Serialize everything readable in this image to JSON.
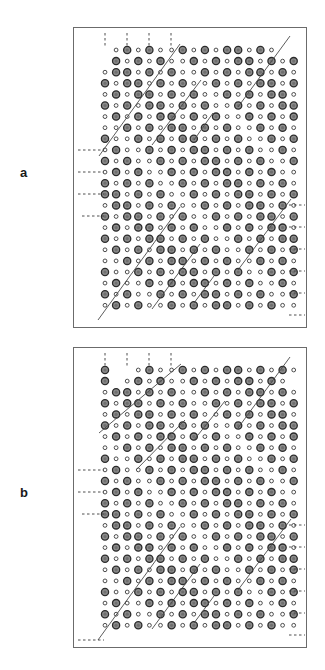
{
  "figure": {
    "type": "crystal-lattice-projection-diagram",
    "background_color": "#ffffff",
    "width": 325,
    "height": 670,
    "panels": [
      {
        "id": "a",
        "label": "a",
        "label_x": 20,
        "label_y": 172,
        "frame": {
          "x": 73,
          "y": 27,
          "w": 234,
          "h": 301
        },
        "origin": {
          "x": 105,
          "y": 50
        },
        "step": 11.1,
        "cols": 18,
        "rows": 24,
        "diagonals": [
          {
            "x1": 99,
            "y1": 156,
            "x2": 180,
            "y2": 44
          },
          {
            "x1": 152,
            "y1": 145,
            "x2": 201,
            "y2": 80
          },
          {
            "x1": 238,
            "y1": 107,
            "x2": 290,
            "y2": 36
          },
          {
            "x1": 194,
            "y1": 140,
            "x2": 213,
            "y2": 113
          },
          {
            "x1": 98,
            "y1": 320,
            "x2": 180,
            "y2": 207
          },
          {
            "x1": 152,
            "y1": 309,
            "x2": 200,
            "y2": 244
          },
          {
            "x1": 238,
            "y1": 270,
            "x2": 291,
            "y2": 199
          },
          {
            "x1": 194,
            "y1": 303,
            "x2": 214,
            "y2": 276
          }
        ],
        "tick_marks_top": [
          {
            "x": 105,
            "y1": 33,
            "y2": 48
          },
          {
            "x": 127,
            "y1": 33,
            "y2": 48
          },
          {
            "x": 149,
            "y1": 33,
            "y2": 48
          },
          {
            "x": 171,
            "y1": 33,
            "y2": 48
          }
        ],
        "tick_marks_left": [
          {
            "y": 150,
            "x1": 78,
            "x2": 104
          },
          {
            "y": 172,
            "x1": 78,
            "x2": 104
          },
          {
            "y": 194,
            "x1": 78,
            "x2": 104
          },
          {
            "y": 216,
            "x1": 82,
            "x2": 104
          }
        ],
        "tick_marks_right": [
          {
            "y": 205,
            "x1": 289,
            "x2": 305
          },
          {
            "y": 227,
            "x1": 289,
            "x2": 305
          },
          {
            "y": 249,
            "x1": 289,
            "x2": 305
          },
          {
            "y": 271,
            "x1": 289,
            "x2": 305
          },
          {
            "y": 293,
            "x1": 289,
            "x2": 305
          },
          {
            "y": 315,
            "x1": 289,
            "x2": 305
          }
        ]
      },
      {
        "id": "b",
        "label": "b",
        "label_x": 20,
        "label_y": 492,
        "frame": {
          "x": 73,
          "y": 347,
          "w": 234,
          "h": 301
        },
        "origin": {
          "x": 105,
          "y": 370
        },
        "step": 11.1,
        "cols": 18,
        "rows": 24,
        "diagonals": [
          {
            "x1": 99,
            "y1": 433,
            "x2": 181,
            "y2": 364
          },
          {
            "x1": 136,
            "y1": 470,
            "x2": 185,
            "y2": 420
          },
          {
            "x1": 238,
            "y1": 428,
            "x2": 290,
            "y2": 357
          },
          {
            "x1": 194,
            "y1": 440,
            "x2": 225,
            "y2": 401
          },
          {
            "x1": 98,
            "y1": 640,
            "x2": 180,
            "y2": 527
          },
          {
            "x1": 152,
            "y1": 629,
            "x2": 200,
            "y2": 564
          },
          {
            "x1": 238,
            "y1": 590,
            "x2": 291,
            "y2": 519
          },
          {
            "x1": 194,
            "y1": 623,
            "x2": 214,
            "y2": 596
          }
        ],
        "tick_marks_top": [
          {
            "x": 105,
            "y1": 353,
            "y2": 368
          },
          {
            "x": 127,
            "y1": 353,
            "y2": 368
          },
          {
            "x": 149,
            "y1": 353,
            "y2": 368
          },
          {
            "x": 171,
            "y1": 353,
            "y2": 368
          }
        ],
        "tick_marks_left": [
          {
            "y": 470,
            "x1": 78,
            "x2": 104
          },
          {
            "y": 492,
            "x1": 78,
            "x2": 104
          },
          {
            "y": 514,
            "x1": 82,
            "x2": 104
          },
          {
            "y": 640,
            "x1": 78,
            "x2": 104
          }
        ],
        "tick_marks_right": [
          {
            "y": 525,
            "x1": 289,
            "x2": 305
          },
          {
            "y": 547,
            "x1": 289,
            "x2": 305
          },
          {
            "y": 569,
            "x1": 289,
            "x2": 305
          },
          {
            "y": 591,
            "x1": 289,
            "x2": 305
          },
          {
            "y": 613,
            "x1": 289,
            "x2": 305
          },
          {
            "y": 635,
            "x1": 289,
            "x2": 305
          }
        ]
      }
    ]
  },
  "style": {
    "frame_stroke": "#6b6b6b",
    "large_dot_fill": "#8c8c8c",
    "large_dot_stroke": "#2b2b2b",
    "large_dot_r": 3.6,
    "small_dot_fill": "#ffffff",
    "small_dot_stroke": "#3a3a3a",
    "small_dot_r": 1.9,
    "line_stroke": "#4a4a4a",
    "dash_stroke": "#3a3a3a",
    "label_color": "#1a1a1a"
  },
  "lattice_a": {
    "description": "Alternating large shaded and small open circle lattice, panel a",
    "rows": [
      "..SLSL.ooooooooooooo",
      "LLL.ooooooooooooooLL",
      "ssss.ooooooooooooLLo",
      "LLLLooooooooooooLLoo",
      "sssLooooooooooLLoooo",
      "LLLLooooooooLLLooooo",
      "ssLLoooooooLLoooooLL"
    ],
    "pattern_note": "Large filled circles alternate with small open circles along rows and columns forming a checkerboard superlattice with diagonal antiphase boundaries."
  },
  "lattice_b": {
    "description": "Alternating large shaded and small open circle lattice, panel b",
    "pattern_note": "Same superlattice motif as panel a but with a different arrangement of diagonal antiphase boundary segments."
  }
}
